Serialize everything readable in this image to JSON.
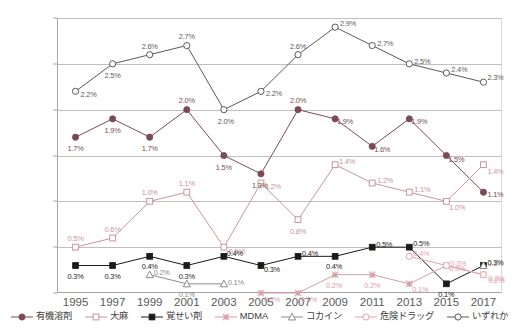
{
  "chart_data": {
    "type": "line",
    "title": "",
    "xlabel": "",
    "ylabel": "",
    "ylim": [
      0.0,
      3.0
    ],
    "ytick_values": [
      0.0,
      0.5,
      1.0,
      1.5,
      2.0,
      2.5,
      3.0
    ],
    "ytick_labels": [
      "0.0%",
      "0.5%",
      "1.0%",
      "1.5%",
      "2.0%",
      "2.5%",
      "3.0%"
    ],
    "grid": true,
    "legend_position": "bottom",
    "categories": [
      "1995",
      "1997",
      "1999",
      "2001",
      "2003",
      "2005",
      "2007",
      "2009",
      "2011",
      "2013",
      "2015",
      "2017"
    ],
    "series": [
      {
        "name": "有機溶剤",
        "color": "#7B4A52",
        "marker": "circle-filled",
        "values": [
          1.7,
          1.9,
          1.7,
          2.0,
          1.5,
          1.3,
          2.0,
          1.9,
          1.6,
          1.9,
          1.5,
          1.1
        ],
        "labels": [
          "1.7%",
          "1.9%",
          "1.7%",
          "2.0%",
          "1.5%",
          "1.3%",
          "2.0%",
          "1.9%",
          "1.6%",
          "1.9%",
          "1.5%",
          "1.1%"
        ]
      },
      {
        "name": "大麻",
        "color": "#C9959B",
        "marker": "square-open",
        "values": [
          0.5,
          0.6,
          1.0,
          1.1,
          0.5,
          1.2,
          0.8,
          1.4,
          1.2,
          1.1,
          1.0,
          1.4
        ],
        "labels": [
          "0.5%",
          "0.6%",
          "1.0%",
          "1.1%",
          "0.5%",
          "1.2%",
          "0.8%",
          "1.4%",
          "1.2%",
          "1.1%",
          "1.0%",
          "1.4%"
        ]
      },
      {
        "name": "覚せい剤",
        "color": "#1A1A1A",
        "marker": "square-filled",
        "values": [
          0.3,
          0.3,
          0.4,
          0.3,
          0.4,
          0.3,
          0.4,
          0.4,
          0.5,
          0.5,
          0.1,
          0.3
        ],
        "labels": [
          "0.3%",
          "0.3%",
          "0.4%",
          "0.3%",
          "0.4%",
          "0.3%",
          "0.4%",
          "0.4%",
          "0.5%",
          "0.5%",
          "0.1%",
          "0.3%"
        ]
      },
      {
        "name": "MDMA",
        "color": "#D99EA6",
        "marker": "cross",
        "values": [
          null,
          null,
          null,
          null,
          null,
          0.0,
          0.0,
          0.2,
          0.2,
          0.1,
          0.3,
          0.2
        ],
        "labels": [
          "",
          "",
          "",
          "",
          "",
          "0.0%",
          "0.0%",
          "0.2%",
          "0.2%",
          "0.1%",
          "0.3%",
          "0.2%"
        ]
      },
      {
        "name": "コカイン",
        "color": "#8C8C8C",
        "marker": "triangle-open",
        "values": [
          null,
          null,
          0.2,
          0.1,
          0.1,
          null,
          null,
          null,
          null,
          null,
          null,
          0.3
        ],
        "labels": [
          "",
          "",
          "0.2%",
          "0.1%",
          "0.1%",
          "",
          "",
          "",
          "",
          "",
          "",
          "0.3%"
        ]
      },
      {
        "name": "危険ドラッグ",
        "color": "#E8A0AA",
        "marker": "circle-open",
        "values": [
          null,
          null,
          null,
          null,
          null,
          null,
          null,
          null,
          null,
          0.4,
          0.3,
          0.2
        ],
        "labels": [
          "",
          "",
          "",
          "",
          "",
          "",
          "",
          "",
          "",
          "0.4%",
          "0.3%",
          "0.2%"
        ]
      },
      {
        "name": "いずれか",
        "color": "#5A5A5A",
        "marker": "circle-open",
        "values": [
          2.2,
          2.5,
          2.6,
          2.7,
          2.0,
          2.2,
          2.6,
          2.9,
          2.7,
          2.5,
          2.4,
          2.3
        ],
        "labels": [
          "2.2%",
          "2.5%",
          "2.6%",
          "2.7%",
          "2.0%",
          "2.2%",
          "2.6%",
          "2.9%",
          "2.7%",
          "2.5%",
          "2.4%",
          "2.3%"
        ]
      }
    ]
  },
  "label_offsets": {
    "有機溶剤": [
      [
        0,
        11
      ],
      [
        0,
        11
      ],
      [
        0,
        11
      ],
      [
        0,
        -10
      ],
      [
        0,
        11
      ],
      [
        -1,
        11
      ],
      [
        0,
        -10
      ],
      [
        10,
        2
      ],
      [
        10,
        3
      ],
      [
        10,
        2
      ],
      [
        10,
        3
      ],
      [
        12,
        2
      ]
    ],
    "大麻": [
      [
        0,
        -9
      ],
      [
        0,
        -9
      ],
      [
        0,
        -9
      ],
      [
        0,
        -9
      ],
      [
        13,
        4
      ],
      [
        12,
        3
      ],
      [
        0,
        11
      ],
      [
        12,
        -4
      ],
      [
        13,
        -3
      ],
      [
        13,
        -3
      ],
      [
        11,
        6
      ],
      [
        12,
        6
      ]
    ],
    "覚せい剤": [
      [
        0,
        10
      ],
      [
        0,
        10
      ],
      [
        0,
        10
      ],
      [
        0,
        10
      ],
      [
        11,
        -3
      ],
      [
        11,
        3
      ],
      [
        12,
        -3
      ],
      [
        -1,
        10
      ],
      [
        12,
        -3
      ],
      [
        12,
        -4
      ],
      [
        0,
        10
      ],
      [
        12,
        -4
      ]
    ],
    "MDMA": [
      [
        0,
        0
      ],
      [
        0,
        0
      ],
      [
        0,
        0
      ],
      [
        0,
        0
      ],
      [
        0,
        0
      ],
      [
        11,
        6
      ],
      [
        11,
        6
      ],
      [
        -1,
        10
      ],
      [
        0,
        10
      ],
      [
        11,
        5
      ],
      [
        11,
        2
      ],
      [
        13,
        5
      ]
    ],
    "コカイン": [
      [
        0,
        0
      ],
      [
        0,
        0
      ],
      [
        12,
        -3
      ],
      [
        0,
        10
      ],
      [
        12,
        -2
      ],
      [
        0,
        0
      ],
      [
        0,
        0
      ],
      [
        0,
        0
      ],
      [
        0,
        0
      ],
      [
        0,
        0
      ],
      [
        0,
        0
      ],
      [
        12,
        -3
      ]
    ],
    "危険ドラッグ": [
      [
        0,
        0
      ],
      [
        0,
        0
      ],
      [
        0,
        0
      ],
      [
        0,
        0
      ],
      [
        0,
        0
      ],
      [
        0,
        0
      ],
      [
        0,
        0
      ],
      [
        0,
        0
      ],
      [
        0,
        0
      ],
      [
        12,
        -3
      ],
      [
        12,
        -3
      ],
      [
        13,
        3
      ]
    ],
    "いずれか": [
      [
        13,
        3
      ],
      [
        0,
        11
      ],
      [
        0,
        -9
      ],
      [
        0,
        -10
      ],
      [
        2,
        11
      ],
      [
        13,
        2
      ],
      [
        0,
        -9
      ],
      [
        13,
        -4
      ],
      [
        13,
        -3
      ],
      [
        13,
        -3
      ],
      [
        13,
        -4
      ],
      [
        12,
        -5
      ]
    ]
  }
}
